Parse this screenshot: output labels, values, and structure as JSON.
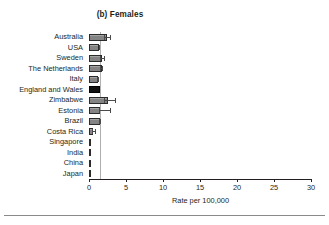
{
  "figure": {
    "title": "(b) Females",
    "footer_rule": true
  },
  "axis": {
    "x_title": "Rate per 100,000",
    "x_ticks": [
      0,
      5,
      10,
      15,
      20,
      25,
      30
    ],
    "x_tick_labels": [
      "0",
      "5",
      "10",
      "15",
      "20",
      "25",
      "30"
    ]
  },
  "style": {
    "bar_fill": "#8c8c8c",
    "bar_edge": "#2b2b2b",
    "highlight_fill": "#111111",
    "error_color": "#4a4a4a",
    "reference_line_color": "#b0b0b0",
    "text_color": "#231f20"
  },
  "chart_data": {
    "type": "bar",
    "orientation": "horizontal",
    "title": "(b) Females",
    "xlabel": "Rate per 100,000",
    "ylabel": "",
    "xlim": [
      0,
      30
    ],
    "grid": false,
    "legend": "none",
    "reference_line": 1.5,
    "highlight_category": "England and Wales",
    "categories": [
      "Australia",
      "USA",
      "Sweden",
      "The Netherlands",
      "Italy",
      "England and Wales",
      "Zimbabwe",
      "Estonia",
      "Brazil",
      "Costa Rica",
      "Singapore",
      "India",
      "China",
      "Japan"
    ],
    "values": [
      2.4,
      1.4,
      1.8,
      1.7,
      1.2,
      1.5,
      2.6,
      1.5,
      1.5,
      0.6,
      0.15,
      0.15,
      0.15,
      0.15
    ],
    "error_high": [
      3.0,
      1.5,
      2.2,
      1.9,
      1.3,
      1.5,
      3.6,
      3.0,
      1.6,
      0.9,
      null,
      null,
      null,
      null
    ],
    "error_low": [
      2.0,
      1.3,
      1.5,
      1.5,
      1.1,
      1.5,
      2.0,
      1.4,
      1.4,
      0.4,
      null,
      null,
      null,
      null
    ]
  }
}
